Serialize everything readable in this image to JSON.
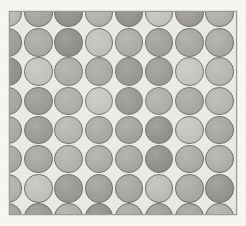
{
  "canvas": {
    "width": 246,
    "height": 226,
    "background_color": "#f8f7f4",
    "description": "Scanned halftone-style plate showing a square lattice of gray discs"
  },
  "panel": {
    "label": "dot pattern plate",
    "x": 9,
    "y": 11,
    "width": 228,
    "height": 204,
    "fill_color": "#eceae5",
    "border_color": "#9b9a95",
    "border_width": 1
  },
  "lattice": {
    "type": "square-grid",
    "cell_pitch_x": 30.2,
    "cell_pitch_y": 29.2,
    "dot_diameter": 28.4,
    "origin_x": -16,
    "origin_y": -13,
    "columns": 9,
    "rows": 8,
    "clipped_at_edges": true,
    "outline_color": "#6f6e6a",
    "tone_palette": {
      "lightest": "#c8c6c0",
      "light": "#bab8b2",
      "mid_light": "#aeaca6",
      "mid": "#a3a19b",
      "mid_dark": "#989691",
      "dark": "#8d8b86",
      "darkest": "#83817c"
    },
    "tone_rows": [
      [
        "#bab8b2",
        "#a3a19b",
        "#8d8b86",
        "#b0aea8",
        "#8d8b86",
        "#c4c2bc",
        "#98968f",
        "#aeaca6",
        "#a3a19b"
      ],
      [
        "#9b9993",
        "#a8a6a0",
        "#8a8883",
        "#bfbdb7",
        "#a8a6a0",
        "#9b9993",
        "#a3a19b",
        "#a8a6a0",
        "#b2b0aa"
      ],
      [
        "#8d8b86",
        "#c2c0ba",
        "#a8a6a0",
        "#a3a19b",
        "#8f8d88",
        "#94928c",
        "#c4c2bc",
        "#b6b4ae",
        "#a3a19b"
      ],
      [
        "#a3a19b",
        "#96948e",
        "#a8a6a0",
        "#c2c0ba",
        "#8d8b86",
        "#a8a6a0",
        "#a3a19b",
        "#b4b2ac",
        "#8f8d88"
      ],
      [
        "#a8a6a0",
        "#96948e",
        "#b2b0aa",
        "#a3a19b",
        "#9b9993",
        "#8a8883",
        "#c2c0ba",
        "#a3a19b",
        "#8d8b86"
      ],
      [
        "#a8a6a0",
        "#a3a19b",
        "#b0aea8",
        "#a8a6a0",
        "#a3a19b",
        "#8a8883",
        "#a8a6a0",
        "#aeaca6",
        "#b6b4ae"
      ],
      [
        "#b2b0aa",
        "#c2c0ba",
        "#96948e",
        "#9b9993",
        "#a3a19b",
        "#bcbab4",
        "#a8a6a0",
        "#94928c",
        "#a3a19b"
      ],
      [
        "#a3a19b",
        "#96948e",
        "#aeaca6",
        "#8d8b86",
        "#a8a6a0",
        "#9b9993",
        "#a3a19b",
        "#b0aea8",
        "#98968f"
      ]
    ]
  }
}
